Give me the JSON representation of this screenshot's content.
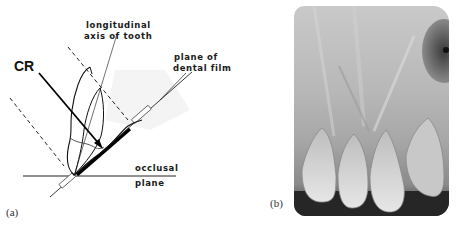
{
  "figure": {
    "panel_a": {
      "caption": "(a)",
      "labels": {
        "central_ray": "CR",
        "tooth_axis_line1": "longitudinal",
        "tooth_axis_line2": "axis of tooth",
        "film_plane_line1": "plane of",
        "film_plane_line2": "dental film",
        "occlusal_line1": "occlusal",
        "occlusal_line2": "plane"
      }
    },
    "panel_b": {
      "caption": "(b)",
      "image_description": "periapical radiograph of maxillary incisors"
    }
  },
  "colors": {
    "ink": "#111111",
    "background": "#ffffff",
    "xray_light": "#c9c9c9",
    "xray_dark": "#2a2a2a"
  }
}
